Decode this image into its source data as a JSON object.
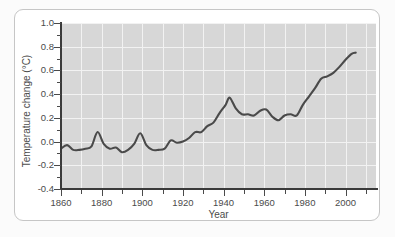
{
  "figure": {
    "background_color": "#ffffff",
    "border_color": "#c6c6c6",
    "plot_background_color": "#d7d7d7",
    "gridline_color": "#f2f2f2",
    "axis_color": "#3a3a3a",
    "series_color": "#4a4a4a"
  },
  "chart_data": {
    "type": "line",
    "title": "",
    "xlabel": "Year",
    "ylabel": "Temperature change (°C)",
    "xlim": [
      1860,
      2015
    ],
    "ylim": [
      -0.4,
      1.0
    ],
    "grid": true,
    "legend": "none",
    "x_major_ticks": [
      1860,
      1880,
      1900,
      1920,
      1940,
      1960,
      1980,
      2000
    ],
    "x_major_tick_labels": [
      "1860",
      "1880",
      "1900",
      "1920",
      "1940",
      "1960",
      "1980",
      "2000"
    ],
    "x_minor_tick_interval": 10,
    "y_major_ticks": [
      -0.4,
      -0.2,
      0.0,
      0.2,
      0.4,
      0.6,
      0.8,
      1.0
    ],
    "y_major_tick_labels": [
      "-0.4",
      "-0.2",
      "0.0",
      "0.2",
      "0.4",
      "0.6",
      "0.8",
      "1.0"
    ],
    "y_minor_tick_interval": 0.1,
    "series": [
      {
        "name": "Global temperature change",
        "x": [
          1860,
          1863,
          1866,
          1869,
          1872,
          1875,
          1878,
          1881,
          1884,
          1887,
          1890,
          1893,
          1896,
          1899,
          1902,
          1905,
          1908,
          1911,
          1914,
          1917,
          1920,
          1923,
          1926,
          1929,
          1932,
          1935,
          1938,
          1941,
          1943,
          1946,
          1949,
          1952,
          1955,
          1958,
          1961,
          1964,
          1967,
          1970,
          1973,
          1976,
          1979,
          1982,
          1985,
          1988,
          1991,
          1994,
          1997,
          2000,
          2003,
          2005
        ],
        "y": [
          -0.06,
          -0.03,
          -0.07,
          -0.07,
          -0.06,
          -0.04,
          0.08,
          -0.02,
          -0.06,
          -0.05,
          -0.09,
          -0.07,
          -0.02,
          0.07,
          -0.03,
          -0.07,
          -0.07,
          -0.06,
          0.01,
          -0.01,
          0.0,
          0.03,
          0.08,
          0.08,
          0.13,
          0.16,
          0.24,
          0.31,
          0.37,
          0.28,
          0.23,
          0.23,
          0.22,
          0.26,
          0.27,
          0.21,
          0.18,
          0.22,
          0.23,
          0.22,
          0.31,
          0.38,
          0.45,
          0.53,
          0.55,
          0.58,
          0.63,
          0.69,
          0.74,
          0.75
        ]
      }
    ]
  }
}
